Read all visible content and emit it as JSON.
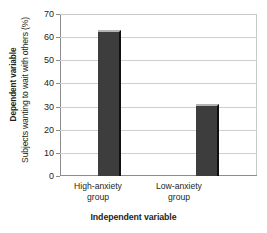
{
  "chart_data": {
    "type": "bar",
    "title": "",
    "categories": [
      "High-anxiety group",
      "Low-anxiety group"
    ],
    "category_lines": [
      [
        "High-anxiety",
        "group"
      ],
      [
        "Low-anxiety",
        "group"
      ]
    ],
    "values": [
      63,
      31
    ],
    "xlabel": "Independent variable",
    "ylabel": "Subjects wanting to wait with others (%)",
    "outer_ylabel": "Dependent variable",
    "ylim": [
      0,
      70
    ],
    "ytick_step": 10,
    "yticks": [
      70,
      60,
      50,
      40,
      30,
      20,
      10,
      0
    ],
    "ytick_labels": [
      "70",
      "60",
      "50",
      "40",
      "30",
      "20",
      "10",
      "0"
    ],
    "grid": true,
    "grid_axis": "y",
    "legend": false,
    "legend_position": "none",
    "colors": {
      "bar_fill": "#3d3d3d",
      "bar_highlight": "#b4b4b4",
      "bar_shadow": "#101010",
      "gridline": "#cfcfcf",
      "axis": "#8c8c8c",
      "text": "#231f20",
      "background": "#ffffff"
    }
  }
}
